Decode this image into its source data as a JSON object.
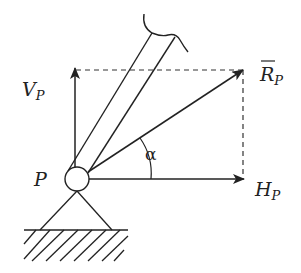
{
  "diagram": {
    "type": "force-resolution",
    "labels": {
      "vertical_force": {
        "main": "V",
        "sub": "P"
      },
      "resultant_force": {
        "main": "R",
        "sub": "P",
        "overbar": true
      },
      "horizontal_force": {
        "main": "H",
        "sub": "P"
      },
      "angle": "α",
      "pin": "P"
    },
    "elements": [
      "beam-member",
      "pin-joint",
      "triangular-support",
      "ground-hatching",
      "vertical-component-arrow",
      "horizontal-component-arrow",
      "resultant-arrow",
      "dashed-construction-lines",
      "angle-arc"
    ],
    "colors": {
      "stroke": "#222222",
      "background": "#ffffff"
    }
  }
}
